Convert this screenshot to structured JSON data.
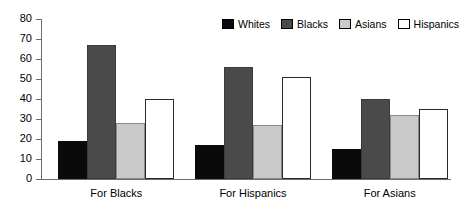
{
  "chart_data": {
    "type": "bar",
    "title": "",
    "subtitle": "",
    "xlabel": "",
    "ylabel": "",
    "categories": [
      "For Blacks",
      "For Hispanics",
      "For Asians"
    ],
    "series": [
      {
        "name": "Whites",
        "color": "#0a0a0a",
        "values": [
          19,
          17,
          15
        ]
      },
      {
        "name": "Blacks",
        "color": "#4a4a4a",
        "values": [
          67,
          56,
          40
        ]
      },
      {
        "name": "Asians",
        "color": "#c9c9c9",
        "values": [
          28,
          27,
          32
        ]
      },
      {
        "name": "Hispanics",
        "color": "#ffffff",
        "values": [
          40,
          51,
          35
        ]
      }
    ],
    "ylim": [
      0,
      80
    ],
    "ytick_step": 10,
    "ytick_labels": [
      "0",
      "10",
      "20",
      "30",
      "40",
      "50",
      "60",
      "70",
      "80"
    ],
    "grid": false,
    "legend_position": "top-right",
    "annotations": []
  },
  "legend": {
    "entries": [
      {
        "label": "Whites"
      },
      {
        "label": "Blacks"
      },
      {
        "label": "Asians"
      },
      {
        "label": "Hispanics"
      }
    ]
  },
  "axes": {
    "y_axis_color": "#6b6b6b",
    "x_axis_color": "#6b6b6b"
  }
}
